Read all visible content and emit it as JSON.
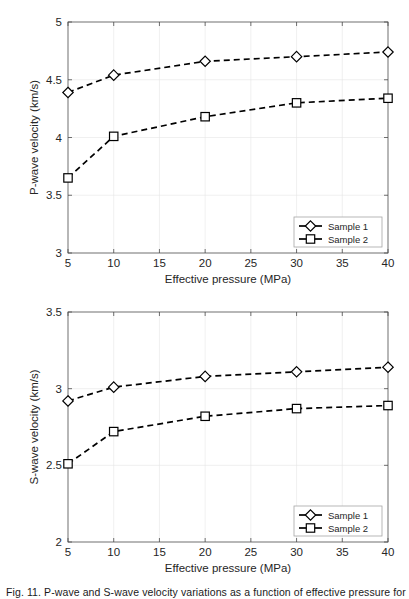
{
  "figure": {
    "caption_partial": "Fig. 11.  P-wave and S-wave velocity variations as a function of effective pressure for"
  },
  "chart_data": [
    {
      "id": "p-wave",
      "type": "line",
      "title": "",
      "xlabel": "Effective pressure (MPa)",
      "ylabel": "P-wave velocity (km/s)",
      "xlim": [
        5,
        40
      ],
      "ylim": [
        3,
        5
      ],
      "xticks": [
        5,
        10,
        15,
        20,
        25,
        30,
        35,
        40
      ],
      "xticklabels": [
        "5",
        "10",
        "15",
        "20",
        "25",
        "30",
        "35",
        "40"
      ],
      "yticks": [
        3,
        3.5,
        4,
        4.5,
        5
      ],
      "yticklabels": [
        "3",
        "3.5",
        "4",
        "4.5",
        "5"
      ],
      "grid": true,
      "legend_position": "lower right",
      "x": [
        5,
        10,
        20,
        30,
        40
      ],
      "series": [
        {
          "name": "Sample 1",
          "marker": "diamond",
          "linestyle": "dashed",
          "values": [
            4.39,
            4.54,
            4.66,
            4.7,
            4.74
          ]
        },
        {
          "name": "Sample 2",
          "marker": "square",
          "linestyle": "dashed",
          "values": [
            3.65,
            4.01,
            4.18,
            4.3,
            4.34
          ]
        }
      ]
    },
    {
      "id": "s-wave",
      "type": "line",
      "title": "",
      "xlabel": "Effective pressure (MPa)",
      "ylabel": "S-wave velocity (km/s)",
      "xlim": [
        5,
        40
      ],
      "ylim": [
        2,
        3.5
      ],
      "xticks": [
        5,
        10,
        15,
        20,
        25,
        30,
        35,
        40
      ],
      "xticklabels": [
        "5",
        "10",
        "15",
        "20",
        "25",
        "30",
        "35",
        "40"
      ],
      "yticks": [
        2,
        2.5,
        3,
        3.5
      ],
      "yticklabels": [
        "2",
        "2.5",
        "3",
        "3.5"
      ],
      "grid": true,
      "legend_position": "lower right",
      "x": [
        5,
        10,
        20,
        30,
        40
      ],
      "series": [
        {
          "name": "Sample 1",
          "marker": "diamond",
          "linestyle": "dashed",
          "values": [
            2.92,
            3.01,
            3.08,
            3.11,
            3.14
          ]
        },
        {
          "name": "Sample 2",
          "marker": "square",
          "linestyle": "dashed",
          "values": [
            2.51,
            2.72,
            2.82,
            2.87,
            2.89
          ]
        }
      ]
    }
  ],
  "colors": {
    "series_line": "#000000",
    "marker_fill": "#ffffff",
    "axis": "#4d4d4d",
    "grid": "#e6e6e6",
    "text": "#262626",
    "background": "#ffffff"
  }
}
